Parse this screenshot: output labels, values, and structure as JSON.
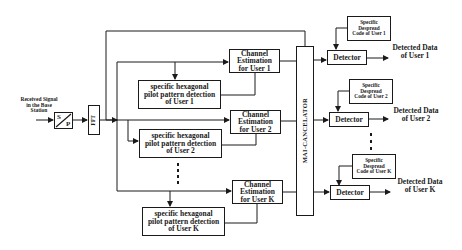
{
  "diagram": {
    "input": {
      "label_lines": [
        "Received Signal",
        "in the Base",
        "Station"
      ]
    },
    "sp_converter": {
      "top": "S",
      "bottom": "P"
    },
    "fft": {
      "label": "FFT"
    },
    "mai_canceller": {
      "label": "MAI-CANCELATOR"
    },
    "users": [
      {
        "channel_estimation": [
          "Channel",
          "Estimation",
          "for User 1"
        ],
        "pilot_detection": [
          "specific hexagonal",
          "pilot pattern detection",
          "of User 1"
        ],
        "despread_code": [
          "Specific",
          "Despread",
          "Code of User 1"
        ],
        "detector": "Detector",
        "output": [
          "Detected Data",
          "of User 1"
        ]
      },
      {
        "channel_estimation": [
          "Channel",
          "Estimation",
          "for User 2"
        ],
        "pilot_detection": [
          "specific hexagonal",
          "pilot pattern detection",
          "of User 2"
        ],
        "despread_code": [
          "Specific",
          "Despread",
          "Code of User 2"
        ],
        "detector": "Detector",
        "output": [
          "Detected Data",
          "of User 2"
        ]
      },
      {
        "channel_estimation": [
          "Channel",
          "Estimation",
          "for User K"
        ],
        "pilot_detection": [
          "specific hexagonal",
          "pilot pattern detection",
          "of User K"
        ],
        "despread_code": [
          "Specific",
          "Despread",
          "Code of User K"
        ],
        "detector": "Detector",
        "output": [
          "Detected Data",
          "of User K"
        ]
      }
    ],
    "ellipsis": "⋮",
    "colors": {
      "line": "#1a1a1a",
      "background": "#ffffff"
    }
  }
}
